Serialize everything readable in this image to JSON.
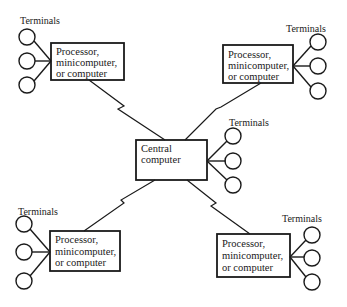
{
  "diagram": {
    "type": "star network topology",
    "colors": {
      "stroke": "#1a1a1a",
      "background": "#ffffff"
    },
    "central": {
      "lines": [
        "Central",
        "computer"
      ],
      "terminals_label": "Terminals",
      "terminal_count": 3
    },
    "nodes": [
      {
        "position": "top-left",
        "lines": [
          "Processor,",
          "minicomputer,",
          "or computer"
        ],
        "terminals_label": "Terminals",
        "terminal_count": 3,
        "link": "zigzag to central"
      },
      {
        "position": "top-right",
        "lines": [
          "Processor,",
          "minicomputer,",
          "or computer"
        ],
        "terminals_label": "Terminals",
        "terminal_count": 3,
        "link": "zigzag to central"
      },
      {
        "position": "bottom-left",
        "lines": [
          "Processor,",
          "minicomputer,",
          "or computer"
        ],
        "terminals_label": "Terminals",
        "terminal_count": 3,
        "link": "zigzag to central"
      },
      {
        "position": "bottom-right",
        "lines": [
          "Processor,",
          "minicomputer,",
          "or computer"
        ],
        "terminals_label": "Terminals",
        "terminal_count": 3,
        "link": "zigzag to central"
      }
    ]
  }
}
